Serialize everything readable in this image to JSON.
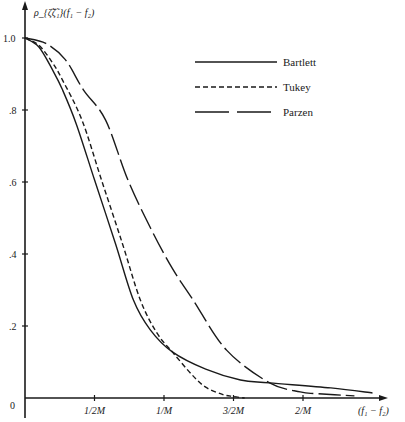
{
  "chart_data": {
    "type": "line",
    "title": "",
    "ylabel": "ρ_{ζ̃ζ̃₁}(f₁ − f₂)",
    "xlabel": "(f₁ − f₂)",
    "xlim": [
      0,
      2.6
    ],
    "ylim": [
      0,
      1.0
    ],
    "grid": false,
    "legend_position": "upper right",
    "x_ticks": [
      {
        "value": 0.5,
        "label": "1/2M"
      },
      {
        "value": 1.0,
        "label": "1/M"
      },
      {
        "value": 1.5,
        "label": "3/2M"
      },
      {
        "value": 2.0,
        "label": "2/M"
      }
    ],
    "y_ticks": [
      {
        "value": 0,
        "label": "0"
      },
      {
        "value": 0.2,
        "label": ".2"
      },
      {
        "value": 0.4,
        "label": ".4"
      },
      {
        "value": 0.6,
        "label": ".6"
      },
      {
        "value": 0.8,
        "label": ".8"
      },
      {
        "value": 1.0,
        "label": "1.0"
      }
    ],
    "series": [
      {
        "name": "Bartlett",
        "style": "solid",
        "x": [
          0,
          0.1,
          0.2,
          0.27,
          0.37,
          0.5,
          0.65,
          0.78,
          0.9,
          1.06,
          1.3,
          1.55,
          1.76,
          2.2,
          2.5
        ],
        "y": [
          1.0,
          0.975,
          0.91,
          0.856,
          0.76,
          0.606,
          0.43,
          0.272,
          0.19,
          0.128,
          0.08,
          0.05,
          0.042,
          0.028,
          0.014
        ]
      },
      {
        "name": "Tukey",
        "style": "dashed",
        "x": [
          0,
          0.1,
          0.2,
          0.27,
          0.41,
          0.55,
          0.7,
          0.83,
          0.95,
          1.06,
          1.2,
          1.3,
          1.42,
          1.5,
          1.58
        ],
        "y": [
          1.0,
          0.98,
          0.93,
          0.883,
          0.772,
          0.606,
          0.43,
          0.272,
          0.18,
          0.128,
          0.065,
          0.03,
          0.01,
          0.004,
          0.0
        ]
      },
      {
        "name": "Parzen",
        "style": "long-dashed",
        "x": [
          0,
          0.15,
          0.29,
          0.42,
          0.58,
          0.74,
          0.91,
          1.06,
          1.21,
          1.45,
          1.76,
          1.98,
          2.1,
          2.37
        ],
        "y": [
          1.0,
          0.985,
          0.94,
          0.856,
          0.772,
          0.606,
          0.467,
          0.36,
          0.272,
          0.133,
          0.042,
          0.017,
          0.012,
          0.006
        ]
      }
    ]
  }
}
